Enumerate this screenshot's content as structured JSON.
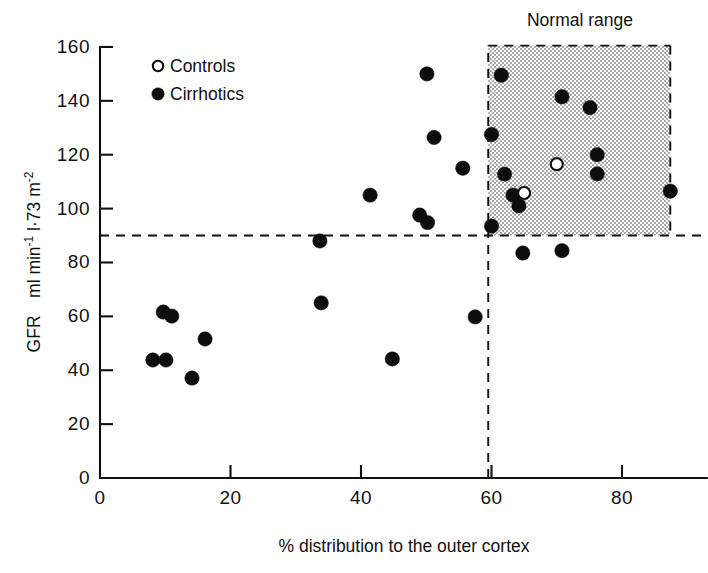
{
  "chart_data": {
    "type": "scatter",
    "title": "",
    "xlabel": "% distribution to the outer cortex",
    "ylabel": "GFR   ml min⁻¹ l·1·73 m⁻²",
    "ylabel_parts": {
      "prefix": "GFR",
      "units": "ml min-1 l·73 m-2"
    },
    "xlim": [
      0,
      93
    ],
    "ylim": [
      0,
      160
    ],
    "xticks": [
      0,
      20,
      40,
      60,
      80
    ],
    "xtick_labels": [
      "0",
      "20",
      "40",
      "60",
      "80"
    ],
    "yticks": [
      0,
      20,
      40,
      60,
      80,
      100,
      120,
      140,
      160
    ],
    "ytick_labels": [
      "0",
      "20",
      "40",
      "60",
      "80",
      "100",
      "120",
      "140",
      "160"
    ],
    "grid": false,
    "legend_position": "upper-left-inside",
    "annotations": [
      {
        "name": "normal-range-label",
        "text": "Normal range",
        "x": 74,
        "y": 167
      },
      {
        "name": "gfr-threshold-line",
        "type": "hline",
        "y": 90,
        "style": "dashed",
        "x_from": 0,
        "x_to": 93
      },
      {
        "name": "cortex-threshold-line",
        "type": "vline",
        "x": 59.5,
        "style": "dashed",
        "y_from": 0,
        "y_to": 160
      },
      {
        "name": "normal-range-box",
        "type": "shaded-rect",
        "x_from": 59.5,
        "x_to": 87.4,
        "y_from": 90,
        "y_to": 160.5,
        "fill": "#cfcfcf",
        "texture": "stipple"
      }
    ],
    "series": [
      {
        "name": "Controls",
        "marker": "open-circle",
        "color": "#ffffff",
        "edge_color": "#0d0d0d",
        "points": [
          {
            "x": 65.0,
            "y": 105.8
          },
          {
            "x": 70.0,
            "y": 116.5
          }
        ]
      },
      {
        "name": "Cirrhotics",
        "marker": "filled-circle",
        "color": "#0d0d0d",
        "edge_color": "#0d0d0d",
        "points": [
          {
            "x": 8.1,
            "y": 43.8
          },
          {
            "x": 10.1,
            "y": 43.8
          },
          {
            "x": 9.7,
            "y": 61.6
          },
          {
            "x": 11.0,
            "y": 60.1
          },
          {
            "x": 14.1,
            "y": 37.1
          },
          {
            "x": 16.1,
            "y": 51.6
          },
          {
            "x": 33.7,
            "y": 88.0
          },
          {
            "x": 33.9,
            "y": 65.0
          },
          {
            "x": 41.4,
            "y": 105.0
          },
          {
            "x": 44.8,
            "y": 44.2
          },
          {
            "x": 49.0,
            "y": 97.6
          },
          {
            "x": 50.2,
            "y": 94.8
          },
          {
            "x": 50.1,
            "y": 150.0
          },
          {
            "x": 51.2,
            "y": 126.4
          },
          {
            "x": 55.6,
            "y": 115.0
          },
          {
            "x": 57.5,
            "y": 59.8
          },
          {
            "x": 60.0,
            "y": 127.5
          },
          {
            "x": 60.0,
            "y": 93.5
          },
          {
            "x": 61.5,
            "y": 149.5
          },
          {
            "x": 62.0,
            "y": 112.8
          },
          {
            "x": 63.3,
            "y": 105.0
          },
          {
            "x": 64.2,
            "y": 101.0
          },
          {
            "x": 64.8,
            "y": 83.5
          },
          {
            "x": 70.8,
            "y": 141.5
          },
          {
            "x": 70.8,
            "y": 84.4
          },
          {
            "x": 75.1,
            "y": 137.5
          },
          {
            "x": 76.2,
            "y": 120.0
          },
          {
            "x": 76.2,
            "y": 112.9
          },
          {
            "x": 87.4,
            "y": 106.5
          }
        ]
      }
    ]
  },
  "legend": {
    "entries": [
      {
        "label": "Controls",
        "marker": "open-circle"
      },
      {
        "label": "Cirrhotics",
        "marker": "filled-circle"
      }
    ]
  },
  "axes": {
    "x_title": "% distribution to the outer cortex",
    "y_title_prefix": "GFR",
    "y_title_units": "ml min",
    "y_exp1": "-1",
    "y_mid": " l·73 m",
    "y_exp2": "-2"
  },
  "normal_range": {
    "label": "Normal range"
  },
  "colors": {
    "ink": "#111111",
    "marker_fill": "#0d0d0d",
    "shade": "#cfcfcf",
    "background": "#ffffff"
  }
}
